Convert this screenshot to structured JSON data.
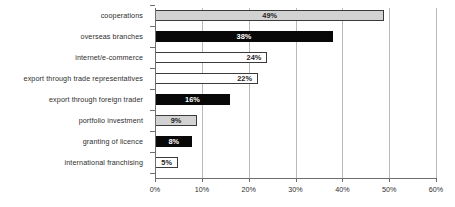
{
  "chart_data": {
    "type": "bar",
    "orientation": "horizontal",
    "title": "",
    "subtitle": "",
    "xlabel": "",
    "ylabel": "",
    "xlim": [
      0,
      60
    ],
    "xtick_labels": [
      "0%",
      "10%",
      "20%",
      "30%",
      "40%",
      "50%",
      "60%"
    ],
    "xticks": [
      0,
      10,
      20,
      30,
      40,
      50,
      60
    ],
    "grid": "vertical",
    "legend": "none",
    "value_suffix": "%",
    "categories": [
      "cooperations",
      "overseas branches",
      "internet/e-commerce",
      "export through trade representatives",
      "export through foreign trader",
      "portfolio investment",
      "granting of licence",
      "international franchising"
    ],
    "values": [
      49,
      38,
      24,
      22,
      16,
      9,
      8,
      5
    ],
    "value_labels": [
      "49%",
      "38%",
      "24%",
      "22%",
      "16%",
      "9%",
      "8%",
      "5%"
    ],
    "bar_styles": [
      "gray",
      "black",
      "white",
      "white",
      "black",
      "gray",
      "black",
      "white"
    ],
    "label_placement": [
      "inside-center",
      "inside-center",
      "inside-right",
      "inside-right",
      "inside-center",
      "inside-center",
      "inside-center",
      "inside-center"
    ],
    "colors": {
      "gray_fill": "#d2d2d2",
      "black_fill": "#080808",
      "white_fill": "#ffffff",
      "bar_border": "#3a3a3a",
      "gridline": "#b9b9b9",
      "axis": "#6e6e6e",
      "text": "#2e2e2e",
      "background": "#ffffff"
    }
  }
}
